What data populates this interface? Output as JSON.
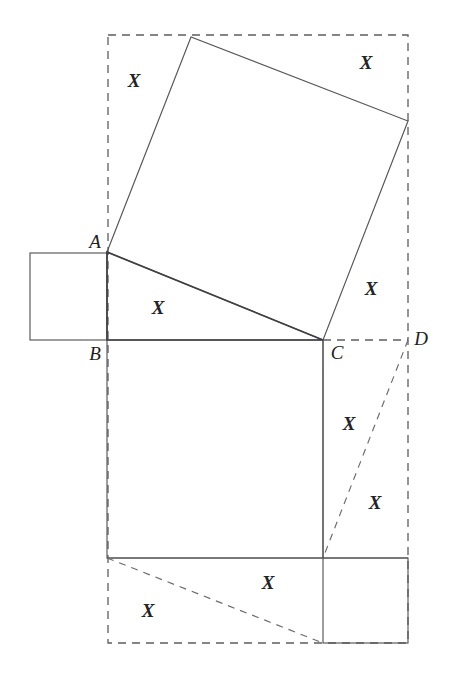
{
  "figure": {
    "kind": "geometry-diagram",
    "caption": "",
    "background_color": "#ffffff",
    "stroke_color": "#55555a",
    "dashed_color": "#5d5d63",
    "label_color": "#232327",
    "canvas": {
      "width": 451,
      "height": 683
    }
  },
  "vertex_labels": [
    {
      "text": "A",
      "x": 95,
      "y": 241
    },
    {
      "text": "B",
      "x": 95,
      "y": 353
    },
    {
      "text": "C",
      "x": 337,
      "y": 352
    },
    {
      "text": "D",
      "x": 421,
      "y": 338
    }
  ],
  "area_labels": [
    {
      "text": "X",
      "x": 134,
      "y": 80,
      "region": "upper-left-corner-of-dashed-box"
    },
    {
      "text": "X",
      "x": 366,
      "y": 62,
      "region": "upper-right-corner-of-dashed-box"
    },
    {
      "text": "X",
      "x": 158,
      "y": 307,
      "region": "triangle-abc"
    },
    {
      "text": "X",
      "x": 371,
      "y": 288,
      "region": "right-of-square-above-c"
    },
    {
      "text": "X",
      "x": 349,
      "y": 423,
      "region": "right-strip-upper"
    },
    {
      "text": "X",
      "x": 375,
      "y": 502,
      "region": "right-strip-lower"
    },
    {
      "text": "X",
      "x": 268,
      "y": 582,
      "region": "bottom-strip-right"
    },
    {
      "text": "X",
      "x": 148,
      "y": 610,
      "region": "bottom-strip-left"
    }
  ],
  "geometry": {
    "dashed_bounding_box": {
      "x": 108,
      "y": 35,
      "width": 300,
      "height": 608
    },
    "triangle_abc": {
      "points": "107,252 107,340 323,340",
      "vertices": {
        "A": [
          107,
          252
        ],
        "B": [
          107,
          340
        ],
        "C": [
          323,
          340
        ]
      }
    },
    "tilted_square_on_hypotenuse": {
      "points": "107,252 191,37 408,121 323,340"
    },
    "left_rectangle_on_ab": {
      "x": 30,
      "y": 253,
      "width": 77,
      "height": 87
    },
    "lower_rectangle_on_bc": {
      "x": 107,
      "y": 340,
      "width": 216,
      "height": 218
    },
    "bottom_right_rectangle": {
      "x": 323,
      "y": 558,
      "width": 85,
      "height": 85
    },
    "bottom_strip_line": {
      "x1": 107,
      "y1": 558,
      "x2": 408,
      "y2": 558
    },
    "dashed_diagonal_right": {
      "x1": 408,
      "y1": 340,
      "x2": 323,
      "y2": 558
    },
    "dashed_diagonal_bottom": {
      "x1": 107,
      "y1": 558,
      "x2": 323,
      "y2": 643
    },
    "dashed_segment_cd": {
      "x1": 323,
      "y1": 340,
      "x2": 408,
      "y2": 340
    }
  }
}
